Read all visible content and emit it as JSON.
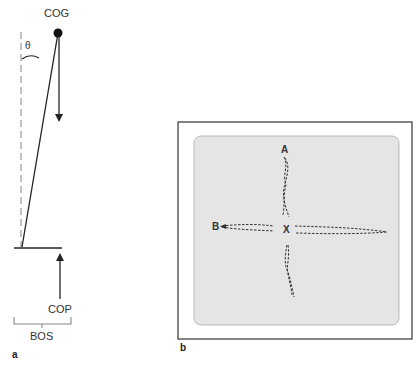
{
  "panel_a": {
    "label": "a",
    "cog_label": "COG",
    "cop_label": "COP",
    "bos_label": "BOS",
    "angle_label": "θ"
  },
  "panel_b": {
    "label": "b",
    "point_a": "A",
    "point_b": "B",
    "center": "X"
  },
  "colors": {
    "line": "#222222",
    "dashed_vertical": "#999999",
    "gray_panel": "#e4e4e4",
    "bracket": "#888888"
  }
}
